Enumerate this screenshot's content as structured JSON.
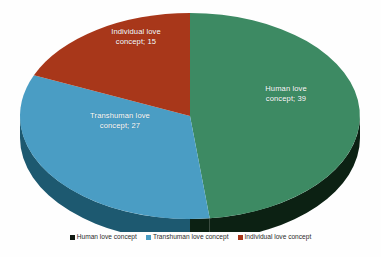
{
  "chart_data": {
    "type": "pie",
    "title": "",
    "categories": [
      "Human love concept",
      "Transhuman love concept",
      "Individual love concept"
    ],
    "values": [
      39,
      27,
      15
    ],
    "total": 81,
    "labels": [
      "Human love concept; 39",
      "Transhuman love concept; 27",
      "Individual love concept; 15"
    ],
    "data_label_format": "category; value",
    "colors": [
      "#3d8a63",
      "#4a9dc4",
      "#a8371a"
    ],
    "side_colors": [
      "#0d2415",
      "#1f5f77",
      "#6b2310"
    ],
    "legend_swatch_colors": [
      "#101a12",
      "#4a9dc4",
      "#a8371a"
    ],
    "legend_position": "bottom",
    "grid": false,
    "three_d": true,
    "start_angle_deg": 0,
    "direction": "clockwise",
    "series": [
      {
        "name": "Love concepts",
        "points": [
          {
            "label": "Human love concept",
            "value": 39,
            "angle_deg": 173.3,
            "color": "#3d8a63"
          },
          {
            "label": "Transhuman love concept",
            "value": 27,
            "angle_deg": 120.0,
            "color": "#4a9dc4"
          },
          {
            "label": "Individual love concept",
            "value": 15,
            "angle_deg": 66.7,
            "color": "#a8371a"
          }
        ]
      }
    ]
  },
  "slice_labels": {
    "human_line1": "Human love",
    "human_line2": "concept; 39",
    "transhuman_line1": "Transhuman love",
    "transhuman_line2": "concept; 27",
    "individual_line1": "Individual love",
    "individual_line2": "concept; 15"
  },
  "legend": {
    "items": [
      {
        "label": "Human love concept",
        "color": "#101a12"
      },
      {
        "label": "Transhuman love concept",
        "color": "#4a9dc4"
      },
      {
        "label": "Individual love concept",
        "color": "#a8371a"
      }
    ]
  }
}
